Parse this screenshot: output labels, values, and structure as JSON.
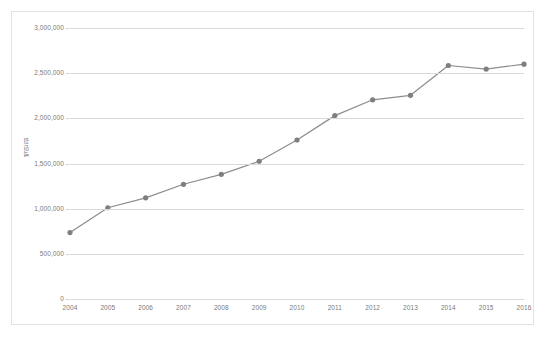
{
  "chart_data": {
    "type": "line",
    "title": "",
    "xlabel": "",
    "ylabel": "백만원",
    "categories": [
      "2004",
      "2005",
      "2006",
      "2007",
      "2008",
      "2009",
      "2010",
      "2011",
      "2012",
      "2013",
      "2014",
      "2015",
      "2016"
    ],
    "values": [
      735000,
      1010000,
      1120000,
      1270000,
      1380000,
      1525000,
      1760000,
      2030000,
      2205000,
      2255000,
      2585000,
      2545000,
      2600000
    ],
    "series": [
      {
        "name": "매출액",
        "values": [
          735000,
          1010000,
          1120000,
          1270000,
          1380000,
          1525000,
          1760000,
          2030000,
          2205000,
          2255000,
          2585000,
          2545000,
          2600000
        ]
      }
    ],
    "ytick_labels": [
      "0",
      "500,000",
      "1,000,000",
      "1,500,000",
      "2,000,000",
      "2,500,000",
      "3,000,000"
    ],
    "ytick_values": [
      0,
      500000,
      1000000,
      1500000,
      2000000,
      2500000,
      3000000
    ],
    "ylim": [
      0,
      3000000
    ],
    "xlim": [
      "2004",
      "2016"
    ],
    "grid": true,
    "legend": false,
    "legend_position": "none",
    "line_color": "#8c8c8c",
    "marker_color": "#7f7f7f",
    "gridline_color": "#d9d9d9",
    "tick_label_color": "#7a7a7a",
    "border_color": "#e2e2e2",
    "background_color": "#ffffff"
  }
}
